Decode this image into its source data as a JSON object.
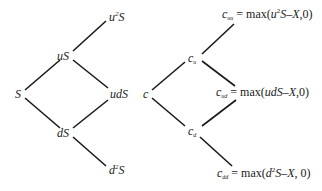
{
  "stock_tree": {
    "root": {
      "base": "S"
    },
    "up": {
      "base": "uS"
    },
    "down": {
      "base": "dS"
    },
    "up_up": {
      "pre": "u",
      "exp": "2",
      "post": "S"
    },
    "up_down": {
      "base": "udS"
    },
    "down_down": {
      "pre": "d",
      "exp": "2",
      "post": "S"
    }
  },
  "option_tree": {
    "root": {
      "base": "c"
    },
    "up": {
      "base": "c",
      "sub": "u"
    },
    "down": {
      "base": "c",
      "sub": "d"
    },
    "up_up": {
      "base": "c",
      "sub": "uu",
      "eq_pre": " = max(",
      "var_pre": "u",
      "exp": "2",
      "var_post": "S–X",
      "eq_post": ",0)"
    },
    "up_down": {
      "base": "c",
      "sub": "ud",
      "eq_pre": " = max(",
      "var_pre": "udS–X",
      "eq_post": ",0)"
    },
    "down_down": {
      "base": "c",
      "sub": "dd",
      "eq_pre": " = max(",
      "var_pre": "d",
      "exp": "2",
      "var_post": "S–X",
      "eq_post": ", 0)"
    }
  },
  "colors": {
    "line": "#1a1a1a",
    "text": "#1a1a1a",
    "background": "#ffffff"
  }
}
